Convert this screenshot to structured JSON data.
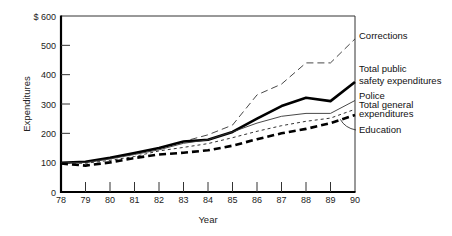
{
  "chart_data": {
    "type": "line",
    "title": "",
    "xlabel": "Year",
    "ylabel": "Expenditures",
    "x": [
      78,
      79,
      80,
      81,
      82,
      83,
      84,
      85,
      86,
      87,
      88,
      89,
      90
    ],
    "x_tick_labels": [
      "78",
      "79",
      "80",
      "81",
      "82",
      "83",
      "84",
      "85",
      "86",
      "87",
      "88",
      "89",
      "90"
    ],
    "y_tick_labels": [
      "0",
      "100",
      "200",
      "300",
      "400",
      "500",
      "$ 600"
    ],
    "y_ticks": [
      0,
      100,
      200,
      300,
      400,
      500,
      600
    ],
    "ylim": [
      0,
      600
    ],
    "xlim": [
      78,
      90
    ],
    "grid": false,
    "legend_position": "right, direct labels at line ends",
    "series": [
      {
        "name": "Corrections",
        "label_lines": [
          "Corrections"
        ],
        "style": "long-dash thin",
        "values": [
          100,
          102,
          115,
          130,
          148,
          172,
          195,
          228,
          331,
          368,
          440,
          440,
          522
        ]
      },
      {
        "name": "Total public safety expenditures",
        "label_lines": [
          "Total public",
          " safety expenditures"
        ],
        "style": "solid thick",
        "values": [
          100,
          103,
          117,
          133,
          150,
          172,
          178,
          205,
          250,
          293,
          321,
          310,
          375
        ]
      },
      {
        "name": "Police",
        "label_lines": [
          "Police"
        ],
        "style": "solid thin",
        "values": [
          100,
          101,
          113,
          128,
          144,
          166,
          178,
          205,
          235,
          258,
          268,
          268,
          312
        ]
      },
      {
        "name": "Total general expenditures",
        "label_lines": [
          "Total general",
          " expenditures"
        ],
        "style": "short-dash thin",
        "values": [
          100,
          98,
          108,
          121,
          140,
          152,
          165,
          185,
          207,
          226,
          241,
          252,
          282
        ]
      },
      {
        "name": "Education",
        "label_lines": [
          "Education"
        ],
        "style": "dash thick",
        "values": [
          97,
          90,
          101,
          116,
          128,
          134,
          142,
          158,
          180,
          200,
          215,
          235,
          262
        ]
      }
    ]
  }
}
